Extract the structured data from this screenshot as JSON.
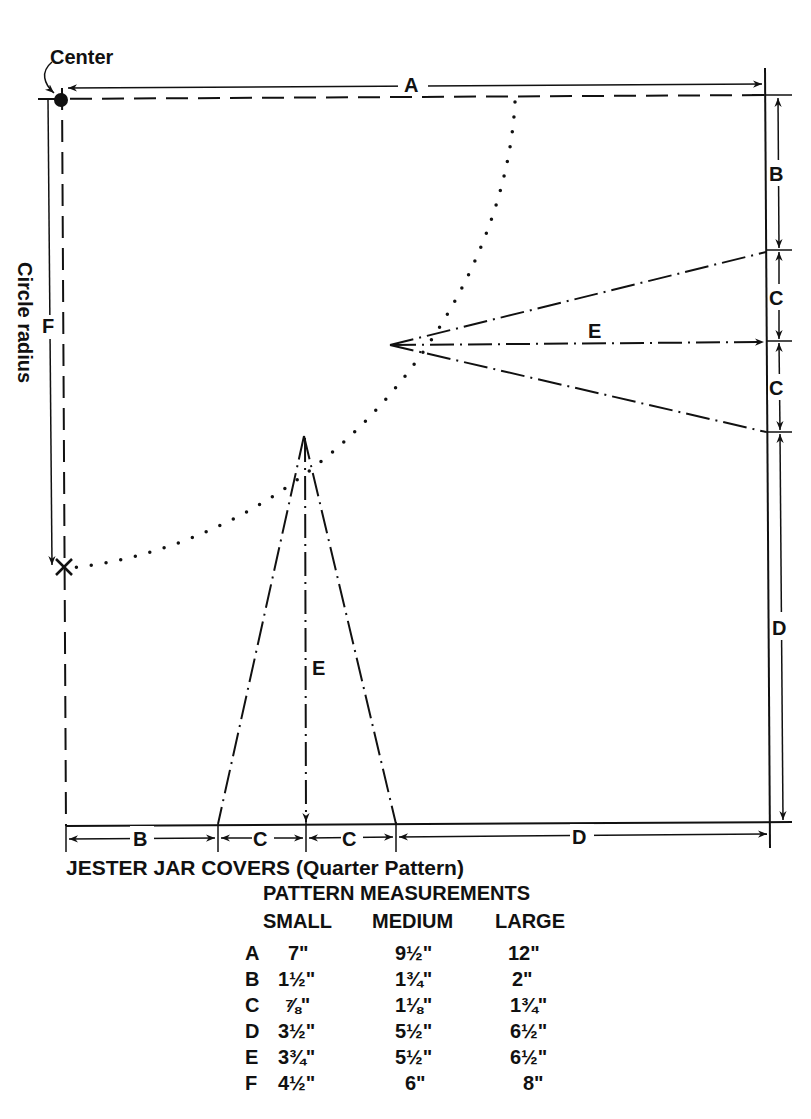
{
  "diagram": {
    "labels": {
      "center": "Center",
      "circle_radius": "Circle radius",
      "A": "A",
      "B_right": "B",
      "C_right_top": "C",
      "C_right_bottom": "C",
      "D_right": "D",
      "E_horizontal": "E",
      "E_vertical": "E",
      "F": "F",
      "B_bottom": "B",
      "C_bottom_left": "C",
      "C_bottom_right": "C",
      "D_bottom": "D"
    }
  },
  "caption": {
    "title": "JESTER JAR COVERS (Quarter Pattern)",
    "table_title": "PATTERN MEASUREMENTS"
  },
  "table": {
    "columns": [
      "SMALL",
      "MEDIUM",
      "LARGE"
    ],
    "rows": [
      {
        "key": "A",
        "small": "7\"",
        "medium": "9½\"",
        "large": "12\""
      },
      {
        "key": "B",
        "small": "1½\"",
        "medium": "1¾\"",
        "large": "2\""
      },
      {
        "key": "C",
        "small": "⅞\"",
        "medium": "1⅛\"",
        "large": "1¾\""
      },
      {
        "key": "D",
        "small": "3½\"",
        "medium": "5½\"",
        "large": "6½\""
      },
      {
        "key": "E",
        "small": "3¾\"",
        "medium": "5½\"",
        "large": "6½\""
      },
      {
        "key": "F",
        "small": "4½\"",
        "medium": "6\"",
        "large": "8\""
      }
    ]
  }
}
